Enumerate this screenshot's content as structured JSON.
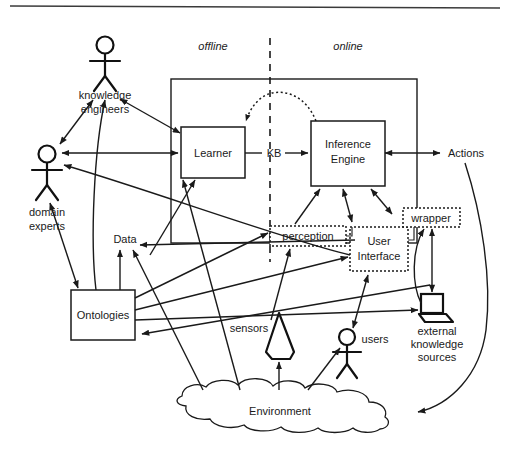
{
  "figure": {
    "phases": [
      {
        "id": "offline",
        "label": "offline"
      },
      {
        "id": "online",
        "label": "online"
      }
    ],
    "nodes": {
      "learner": {
        "label": "Learner",
        "shape": "rectangle",
        "style": "solid"
      },
      "inference_engine": {
        "label": "Inference\nEngine",
        "line1": "Inference",
        "line2": "Engine",
        "shape": "rectangle",
        "style": "solid"
      },
      "ontologies": {
        "label": "Ontologies",
        "shape": "rectangle",
        "style": "solid"
      },
      "perception": {
        "label": "perception",
        "shape": "rectangle",
        "style": "dotted"
      },
      "user_interface": {
        "line1": "User",
        "line2": "Interface",
        "shape": "rectangle",
        "style": "dotted"
      },
      "wrapper": {
        "label": "wrapper",
        "shape": "rectangle",
        "style": "dotted"
      },
      "environment": {
        "label": "Environment",
        "shape": "cloud"
      },
      "sensors": {
        "label": "sensors",
        "shape": "sensor-cone"
      },
      "knowledge_engineers": {
        "line1": "knowledge",
        "line2": "engineers",
        "shape": "stick-figure"
      },
      "domain_experts": {
        "line1": "domain",
        "line2": "experts",
        "shape": "stick-figure"
      },
      "users": {
        "label": "users",
        "shape": "stick-figure"
      },
      "external_knowledge_sources": {
        "line1": "external",
        "line2": "knowledge",
        "line3": "sources",
        "shape": "laptop"
      }
    },
    "edge_labels": {
      "kb": "KB",
      "data": "Data",
      "actions": "Actions"
    },
    "colors": {
      "stroke": "#1a1a1a",
      "background": "#ffffff",
      "text": "#1a1a1a"
    }
  }
}
